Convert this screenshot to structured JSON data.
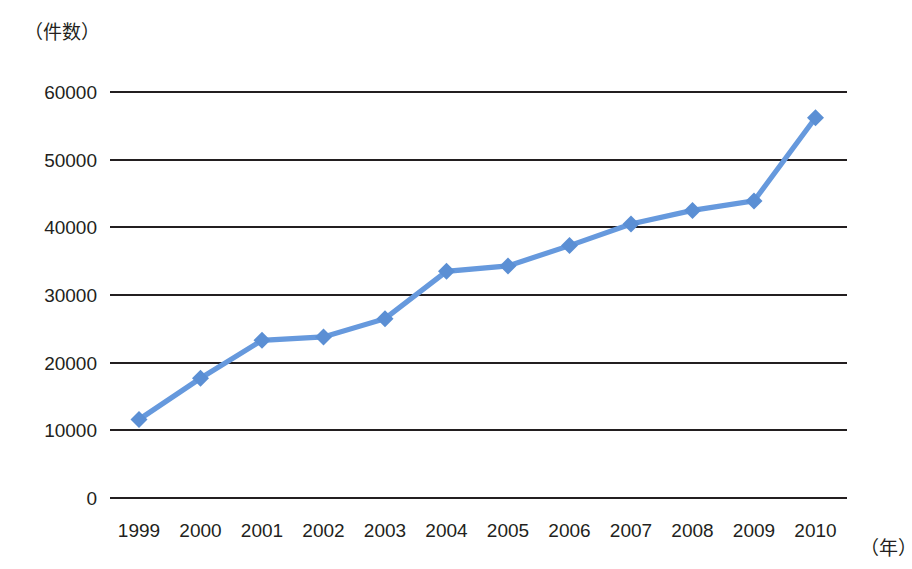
{
  "chart_data": {
    "type": "line",
    "title": "",
    "subtitle": "",
    "xlabel": "（年）",
    "ylabel": "（件数）",
    "categories": [
      "1999",
      "2000",
      "2001",
      "2002",
      "2003",
      "2004",
      "2005",
      "2006",
      "2007",
      "2008",
      "2009",
      "2010"
    ],
    "values": [
      11600,
      17700,
      23300,
      23800,
      26500,
      33500,
      34300,
      37300,
      40500,
      42500,
      43900,
      56200
    ],
    "series": [
      {
        "name": "件数",
        "values": [
          11600,
          17700,
          23300,
          23800,
          26500,
          33500,
          34300,
          37300,
          40500,
          42500,
          43900,
          56200
        ]
      }
    ],
    "ylim": [
      0,
      60000
    ],
    "ytick_labels": [
      "0",
      "10000",
      "20000",
      "30000",
      "40000",
      "50000",
      "60000"
    ],
    "ytick_values": [
      0,
      10000,
      20000,
      30000,
      40000,
      50000,
      60000
    ],
    "xtick_labels": [
      "1999",
      "2000",
      "2001",
      "2002",
      "2003",
      "2004",
      "2005",
      "2006",
      "2007",
      "2008",
      "2009",
      "2010"
    ],
    "grid": true,
    "grid_axis": "y",
    "legend": false,
    "legend_position": "none",
    "marker": "diamond",
    "colors": {
      "series_line": "#6699dd",
      "series_marker": "#5b8fd4",
      "grid": "#231f20",
      "axis": "#231f20",
      "text": "#231f20",
      "background": "#ffffff"
    }
  },
  "layout": {
    "plot_left": 110,
    "plot_right": 847,
    "plot_top": 92,
    "plot_bottom": 498,
    "x_first_center": 139,
    "x_step": 61.5,
    "y_tick_label_x": 97,
    "x_tick_label_y": 531
  }
}
